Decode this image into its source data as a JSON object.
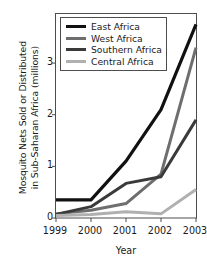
{
  "chart_data": {
    "type": "line",
    "title": "",
    "xlabel": "Year",
    "ylabel": "Mosquito Nets Sold or Distributed\nin Sub-Saharan Africa (millions)",
    "ylabel_line1": "Mosquito Nets Sold or Distributed",
    "ylabel_line2": "in Sub-Saharan Africa (millions)",
    "x": [
      1999,
      2000,
      2001,
      2002,
      2003
    ],
    "categories": [
      "1999",
      "2000",
      "2001",
      "2002",
      "2003"
    ],
    "xlim": [
      1999,
      2003
    ],
    "ylim": [
      0,
      3.95
    ],
    "yticks": [
      0,
      1,
      2,
      3
    ],
    "ytick_labels": [
      "0",
      "1",
      "2",
      "3"
    ],
    "grid": false,
    "legend_position": "top-left-inside",
    "series": [
      {
        "name": "East Africa",
        "color": "#111111",
        "width": 3.2,
        "values": [
          0.35,
          0.35,
          1.1,
          2.1,
          3.75
        ]
      },
      {
        "name": "West Africa",
        "color": "#6e6e6e",
        "width": 3.0,
        "values": [
          0.08,
          0.15,
          0.28,
          0.85,
          3.3
        ]
      },
      {
        "name": "Southern Africa",
        "color": "#3a3a3a",
        "width": 3.0,
        "values": [
          0.07,
          0.22,
          0.67,
          0.8,
          1.9
        ]
      },
      {
        "name": "Central Africa",
        "color": "#b0b0b0",
        "width": 3.0,
        "values": [
          0.05,
          0.07,
          0.12,
          0.08,
          0.55
        ]
      }
    ]
  },
  "legend": {
    "items": [
      {
        "label": "East Africa",
        "color": "#111111"
      },
      {
        "label": "West Africa",
        "color": "#6e6e6e"
      },
      {
        "label": "Southern Africa",
        "color": "#3a3a3a"
      },
      {
        "label": "Central Africa",
        "color": "#b0b0b0"
      }
    ]
  },
  "axes": {
    "frame_color": "#4d4d4d",
    "text_color": "#1a1a1a"
  }
}
